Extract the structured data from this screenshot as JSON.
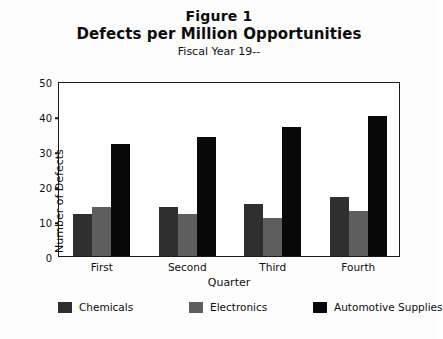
{
  "chart_data": {
    "type": "bar",
    "title": "Defects per Million Opportunities",
    "figure_label": "Figure 1",
    "subtitle": "Fiscal Year 19--",
    "xlabel": "Quarter",
    "ylabel": "Number of Defects",
    "categories": [
      "First",
      "Second",
      "Third",
      "Fourth"
    ],
    "series": [
      {
        "name": "Chemicals",
        "color": "#2f2f2f",
        "values": [
          12,
          14,
          15,
          17
        ]
      },
      {
        "name": "Electronics",
        "color": "#5e5e5e",
        "values": [
          14,
          12,
          11,
          13
        ]
      },
      {
        "name": "Automotive Supplies",
        "color": "#080808",
        "values": [
          32,
          34,
          37,
          40
        ]
      }
    ],
    "ylim": [
      0,
      50
    ],
    "yticks": [
      0,
      10,
      20,
      30,
      40,
      50
    ],
    "ytick_labels": [
      "0",
      "10",
      "20",
      "30",
      "40",
      "50"
    ],
    "grid": false,
    "legend_position": "bottom"
  }
}
